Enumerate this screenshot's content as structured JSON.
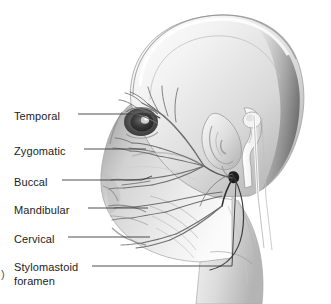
{
  "figure": {
    "background_color": "#ffffff",
    "ink_color": "#1c1c1c",
    "width": 331,
    "height": 304
  },
  "caption": {
    "fragment": ")"
  },
  "labels": [
    {
      "id": "temporal",
      "text": "Temporal",
      "x": 14,
      "y": 110,
      "leader_from_x": 78,
      "leader_from_y": 114,
      "leader_to_x": 152,
      "leader_to_y": 110
    },
    {
      "id": "zygomatic",
      "text": "Zygomatic",
      "x": 14,
      "y": 145,
      "leader_from_x": 82,
      "leader_from_y": 149,
      "leader_to_x": 140,
      "leader_to_y": 147
    },
    {
      "id": "buccal",
      "text": "Buccal",
      "x": 14,
      "y": 176,
      "leader_from_x": 62,
      "leader_from_y": 180,
      "leader_to_x": 140,
      "leader_to_y": 180
    },
    {
      "id": "mandibular",
      "text": "Mandibular",
      "x": 14,
      "y": 204,
      "leader_from_x": 86,
      "leader_from_y": 208,
      "leader_to_x": 144,
      "leader_to_y": 205
    },
    {
      "id": "cervical",
      "text": "Cervical",
      "x": 14,
      "y": 233,
      "leader_from_x": 68,
      "leader_from_y": 237,
      "leader_to_x": 146,
      "leader_to_y": 237
    },
    {
      "id": "stylomastoid-foramen",
      "text": "Stylomastoid",
      "text_line2": "foramen",
      "x": 14,
      "y": 261,
      "leader_from_x": 90,
      "leader_from_y": 266,
      "leader_to_x": 232,
      "leader_to_y": 266
    }
  ],
  "anatomy_parts": [
    {
      "id": "cranium",
      "name": "cranium"
    },
    {
      "id": "orbit-eye",
      "name": "orbit and eye"
    },
    {
      "id": "auricle-ear",
      "name": "auricle (ear)"
    },
    {
      "id": "mandible",
      "name": "mandible"
    },
    {
      "id": "neck",
      "name": "neck"
    },
    {
      "id": "stylomastoid-foramen-point",
      "name": "stylomastoid foramen"
    },
    {
      "id": "nerve-fan",
      "name": "facial nerve branch fan"
    }
  ]
}
